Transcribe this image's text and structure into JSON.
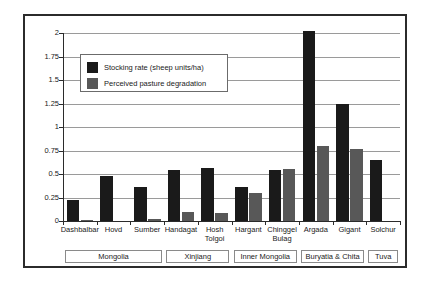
{
  "chart_data": {
    "type": "bar",
    "title": "",
    "subtitle": "",
    "xlabel": "",
    "ylabel": "",
    "ylim": [
      0,
      2
    ],
    "yticks": [
      "0",
      "0.25",
      "0.5",
      "0.75",
      "1",
      "1.25",
      "1.5",
      "1.75",
      "2"
    ],
    "grid": true,
    "legend_position": "upper-left-inside",
    "categories": [
      "Dashbalbar",
      "Hovd",
      "Sumber",
      "Handagat",
      "Hosh Tolgoi",
      "Hargant",
      "Chinggel Bulag",
      "Argada",
      "Gigant",
      "Solchur"
    ],
    "series": [
      {
        "name": "Stocking rate (sheep units/ha)",
        "color": "#1a1a1a",
        "values": [
          0.22,
          0.48,
          0.36,
          0.54,
          0.56,
          0.36,
          0.54,
          2.02,
          1.25,
          0.65
        ]
      },
      {
        "name": "Perceived pasture degradation",
        "color": "#585858",
        "values": [
          0.01,
          0.005,
          0.02,
          0.1,
          0.09,
          0.3,
          0.55,
          0.8,
          0.77,
          0.0
        ]
      }
    ],
    "groups": [
      {
        "label": "Mongolia",
        "categories": [
          "Dashbalbar",
          "Hovd",
          "Sumber"
        ]
      },
      {
        "label": "Xinjiang",
        "categories": [
          "Handagat",
          "Hosh Tolgoi"
        ]
      },
      {
        "label": "Inner Mongolia",
        "categories": [
          "Hargant",
          "Chinggel Bulag"
        ]
      },
      {
        "label": "Buryatia & Chita",
        "categories": [
          "Argada",
          "Gigant"
        ]
      },
      {
        "label": "Tuva",
        "categories": [
          "Solchur"
        ]
      }
    ]
  },
  "legend": {
    "items": [
      {
        "label": "Stocking rate (sheep units/ha)"
      },
      {
        "label": "Perceived pasture degradation"
      }
    ]
  },
  "axis": {
    "y_labels": [
      "2",
      "1.75",
      "1.5",
      "1.25",
      "1",
      "0.75",
      "0.5",
      "0.25",
      "0"
    ]
  },
  "category_labels": [
    {
      "line1": "Dashbalbar",
      "line2": ""
    },
    {
      "line1": "Hovd",
      "line2": ""
    },
    {
      "line1": "Sumber",
      "line2": ""
    },
    {
      "line1": "Handagat",
      "line2": ""
    },
    {
      "line1": "Hosh",
      "line2": "Tolgoi"
    },
    {
      "line1": "Hargant",
      "line2": ""
    },
    {
      "line1": "Chinggel",
      "line2": "Bulag"
    },
    {
      "line1": "Argada",
      "line2": ""
    },
    {
      "line1": "Gigant",
      "line2": ""
    },
    {
      "line1": "Solchur",
      "line2": ""
    }
  ],
  "group_labels": [
    "Mongolia",
    "Xinjiang",
    "Inner Mongolia",
    "Buryatia & Chita",
    "Tuva"
  ],
  "colors": {
    "series_dark": "#1a1a1a",
    "series_grey": "#585858",
    "gridline": "#9a9a9a",
    "axis": "#2b2b2b",
    "frame": "#2b2b2b"
  }
}
